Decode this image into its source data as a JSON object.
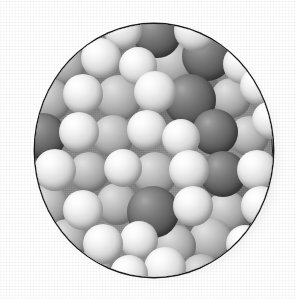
{
  "figure": {
    "kind": "space-filling-molecular-model",
    "shape": "circle",
    "caption": "",
    "background_color": "#ffffff",
    "outline_color": "#1b1b1b",
    "outline_width_px": 1.4,
    "disc": {
      "left": 35,
      "top": 24,
      "width": 238,
      "height": 253,
      "center_x": 154,
      "center_y": 150,
      "radius": 119
    },
    "lighting": {
      "direction": "upper-left",
      "highlight_color": "#ffffff",
      "shadow_color": "#393939"
    },
    "palette": {
      "light_sphere": "#ededed",
      "mid_sphere": "#b6b6b6",
      "dark_sphere": "#5c5c5c",
      "interstitial": "#8f8f8f",
      "rim_shadow": "#1d1d1d"
    },
    "atom_legend": [
      {
        "name": "dark-sphere",
        "meaning": "large dark grey atom",
        "relative_radius": 1.0
      },
      {
        "name": "light-sphere",
        "meaning": "small light grey / white atom",
        "relative_radius": 0.78
      }
    ],
    "atoms": [
      {
        "cx": 52,
        "cy": 12,
        "r": 20,
        "tone": "mid"
      },
      {
        "cx": 88,
        "cy": 6,
        "r": 19,
        "tone": "light"
      },
      {
        "cx": 122,
        "cy": 10,
        "r": 24,
        "tone": "dark"
      },
      {
        "cx": 160,
        "cy": 6,
        "r": 21,
        "tone": "light"
      },
      {
        "cx": 196,
        "cy": 12,
        "r": 20,
        "tone": "mid"
      },
      {
        "cx": 30,
        "cy": 40,
        "r": 21,
        "tone": "mid"
      },
      {
        "cx": 66,
        "cy": 34,
        "r": 20,
        "tone": "light"
      },
      {
        "cx": 103,
        "cy": 42,
        "r": 19,
        "tone": "light"
      },
      {
        "cx": 138,
        "cy": 40,
        "r": 22,
        "tone": "mid"
      },
      {
        "cx": 172,
        "cy": 32,
        "r": 25,
        "tone": "dark"
      },
      {
        "cx": 208,
        "cy": 40,
        "r": 20,
        "tone": "light"
      },
      {
        "cx": 14,
        "cy": 76,
        "r": 22,
        "tone": "mid"
      },
      {
        "cx": 48,
        "cy": 70,
        "r": 20,
        "tone": "light"
      },
      {
        "cx": 84,
        "cy": 74,
        "r": 23,
        "tone": "mid"
      },
      {
        "cx": 120,
        "cy": 68,
        "r": 21,
        "tone": "light"
      },
      {
        "cx": 155,
        "cy": 76,
        "r": 26,
        "tone": "dark"
      },
      {
        "cx": 196,
        "cy": 74,
        "r": 20,
        "tone": "mid"
      },
      {
        "cx": 224,
        "cy": 62,
        "r": 19,
        "tone": "light"
      },
      {
        "cx": 8,
        "cy": 112,
        "r": 23,
        "tone": "dark"
      },
      {
        "cx": 44,
        "cy": 108,
        "r": 20,
        "tone": "light"
      },
      {
        "cx": 78,
        "cy": 112,
        "r": 21,
        "tone": "mid"
      },
      {
        "cx": 112,
        "cy": 106,
        "r": 20,
        "tone": "light"
      },
      {
        "cx": 146,
        "cy": 114,
        "r": 19,
        "tone": "light"
      },
      {
        "cx": 180,
        "cy": 108,
        "r": 23,
        "tone": "dark"
      },
      {
        "cx": 214,
        "cy": 112,
        "r": 20,
        "tone": "mid"
      },
      {
        "cx": 236,
        "cy": 96,
        "r": 19,
        "tone": "light"
      },
      {
        "cx": 20,
        "cy": 146,
        "r": 21,
        "tone": "light"
      },
      {
        "cx": 54,
        "cy": 148,
        "r": 20,
        "tone": "mid"
      },
      {
        "cx": 88,
        "cy": 144,
        "r": 19,
        "tone": "light"
      },
      {
        "cx": 120,
        "cy": 150,
        "r": 22,
        "tone": "mid"
      },
      {
        "cx": 154,
        "cy": 146,
        "r": 20,
        "tone": "light"
      },
      {
        "cx": 188,
        "cy": 150,
        "r": 23,
        "tone": "dark"
      },
      {
        "cx": 222,
        "cy": 146,
        "r": 20,
        "tone": "light"
      },
      {
        "cx": 12,
        "cy": 182,
        "r": 22,
        "tone": "mid"
      },
      {
        "cx": 48,
        "cy": 186,
        "r": 20,
        "tone": "light"
      },
      {
        "cx": 82,
        "cy": 180,
        "r": 21,
        "tone": "mid"
      },
      {
        "cx": 118,
        "cy": 188,
        "r": 26,
        "tone": "dark"
      },
      {
        "cx": 158,
        "cy": 182,
        "r": 20,
        "tone": "light"
      },
      {
        "cx": 192,
        "cy": 188,
        "r": 21,
        "tone": "mid"
      },
      {
        "cx": 226,
        "cy": 182,
        "r": 20,
        "tone": "light"
      },
      {
        "cx": 32,
        "cy": 216,
        "r": 21,
        "tone": "mid"
      },
      {
        "cx": 68,
        "cy": 220,
        "r": 20,
        "tone": "light"
      },
      {
        "cx": 104,
        "cy": 216,
        "r": 19,
        "tone": "light"
      },
      {
        "cx": 140,
        "cy": 222,
        "r": 21,
        "tone": "mid"
      },
      {
        "cx": 176,
        "cy": 216,
        "r": 22,
        "tone": "mid"
      },
      {
        "cx": 210,
        "cy": 220,
        "r": 19,
        "tone": "light"
      },
      {
        "cx": 58,
        "cy": 246,
        "r": 20,
        "tone": "mid"
      },
      {
        "cx": 94,
        "cy": 250,
        "r": 19,
        "tone": "light"
      },
      {
        "cx": 130,
        "cy": 244,
        "r": 21,
        "tone": "light"
      },
      {
        "cx": 166,
        "cy": 250,
        "r": 20,
        "tone": "mid"
      },
      {
        "cx": 200,
        "cy": 244,
        "r": 19,
        "tone": "dark"
      }
    ]
  }
}
